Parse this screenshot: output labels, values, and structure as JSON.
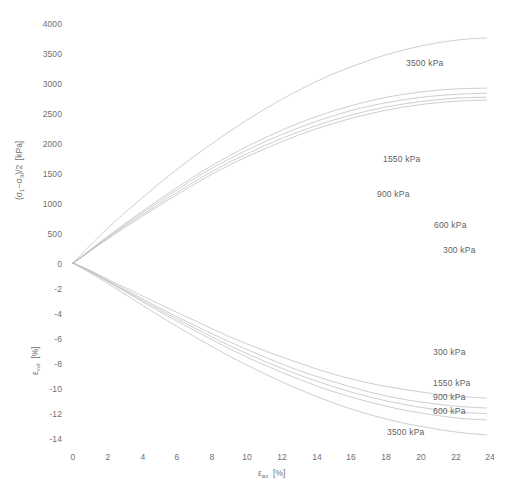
{
  "chart_data": {
    "type": "line",
    "title": "",
    "xlabel": "εax [%]",
    "ylabel_top": "(σ1−σ3)/2  [kPa]",
    "ylabel_bottom": "εvol [%]",
    "grid": false,
    "legend_position": "inline-annotations",
    "xlim": [
      0,
      24
    ],
    "xticks": [
      0,
      2,
      4,
      6,
      8,
      10,
      12,
      14,
      16,
      18,
      20,
      22,
      24
    ],
    "y_top_lim": [
      0,
      4000
    ],
    "y_top_ticks": [
      0,
      500,
      1000,
      1500,
      2000,
      2500,
      3000,
      3500,
      4000
    ],
    "y_bottom_lim": [
      -14,
      0
    ],
    "y_bottom_ticks": [
      0,
      -2,
      -4,
      -6,
      -8,
      -10,
      -12,
      -14
    ],
    "units": {
      "stress": "kPa",
      "strain": "%"
    },
    "confining_pressures": [
      300,
      600,
      900,
      1550,
      3500
    ],
    "series": [
      {
        "name": "3500 kPa",
        "panel": "upper",
        "x": [
          0,
          0.3,
          0.8,
          1.6,
          2.6,
          3.8,
          5.2,
          6.8,
          8.4,
          10.0,
          11.6,
          13.2,
          14.8,
          16.4,
          18.0,
          19.6,
          21.2,
          22.6,
          23.8
        ],
        "y": [
          0,
          90,
          240,
          470,
          740,
          1040,
          1380,
          1740,
          2070,
          2380,
          2660,
          2910,
          3130,
          3310,
          3470,
          3590,
          3680,
          3730,
          3750
        ]
      },
      {
        "name": "1550 kPa",
        "panel": "upper",
        "x": [
          0,
          0.4,
          1.0,
          2.0,
          3.2,
          4.6,
          6.2,
          8.0,
          10.0,
          12.0,
          14.0,
          16.0,
          18.0,
          20.0,
          22.0,
          23.8
        ],
        "y": [
          0,
          85,
          225,
          445,
          700,
          985,
          1300,
          1625,
          1940,
          2210,
          2440,
          2620,
          2760,
          2850,
          2900,
          2915
        ]
      },
      {
        "name": "900 kPa",
        "panel": "upper",
        "x": [
          0,
          0.4,
          1.0,
          2.0,
          3.2,
          4.6,
          6.2,
          8.0,
          10.0,
          12.0,
          14.0,
          16.0,
          18.0,
          20.0,
          22.0,
          23.8
        ],
        "y": [
          0,
          80,
          215,
          430,
          680,
          955,
          1260,
          1580,
          1880,
          2140,
          2360,
          2540,
          2670,
          2760,
          2810,
          2830
        ]
      },
      {
        "name": "600 kPa",
        "panel": "upper",
        "x": [
          0,
          0.4,
          1.0,
          2.0,
          3.2,
          4.6,
          6.2,
          8.0,
          10.0,
          12.0,
          14.0,
          16.0,
          18.0,
          20.0,
          22.0,
          23.8
        ],
        "y": [
          0,
          78,
          208,
          415,
          655,
          920,
          1215,
          1525,
          1820,
          2075,
          2290,
          2465,
          2600,
          2690,
          2745,
          2765
        ]
      },
      {
        "name": "300 kPa",
        "panel": "upper",
        "x": [
          0,
          0.4,
          1.0,
          2.0,
          3.2,
          4.6,
          6.2,
          8.0,
          10.0,
          12.0,
          14.0,
          16.0,
          18.0,
          20.0,
          22.0,
          23.8
        ],
        "y": [
          0,
          75,
          200,
          400,
          630,
          890,
          1175,
          1480,
          1770,
          2020,
          2235,
          2410,
          2545,
          2640,
          2695,
          2715
        ]
      },
      {
        "name": "300 kPa",
        "panel": "lower",
        "x": [
          0,
          1.0,
          2.0,
          3.5,
          5.0,
          7.0,
          9.0,
          11.0,
          13.0,
          15.0,
          17.0,
          19.0,
          21.0,
          22.5,
          23.8
        ],
        "y": [
          0,
          -0.6,
          -1.3,
          -2.3,
          -3.3,
          -4.6,
          -5.9,
          -7.0,
          -8.0,
          -8.9,
          -9.6,
          -10.1,
          -10.5,
          -10.7,
          -10.8
        ]
      },
      {
        "name": "1550 kPa",
        "panel": "lower",
        "x": [
          0,
          1.0,
          2.0,
          3.5,
          5.0,
          7.0,
          9.0,
          11.0,
          13.0,
          15.0,
          17.0,
          19.0,
          21.0,
          22.5,
          23.8
        ],
        "y": [
          0,
          -0.65,
          -1.4,
          -2.5,
          -3.6,
          -5.0,
          -6.3,
          -7.5,
          -8.6,
          -9.5,
          -10.3,
          -10.9,
          -11.3,
          -11.5,
          -11.6
        ]
      },
      {
        "name": "900 kPa",
        "panel": "lower",
        "x": [
          0,
          1.0,
          2.0,
          3.5,
          5.0,
          7.0,
          9.0,
          11.0,
          13.0,
          15.0,
          17.0,
          19.0,
          21.0,
          22.5,
          23.8
        ],
        "y": [
          0,
          -0.7,
          -1.45,
          -2.6,
          -3.75,
          -5.2,
          -6.6,
          -7.85,
          -8.95,
          -9.9,
          -10.7,
          -11.3,
          -11.75,
          -11.95,
          -12.05
        ]
      },
      {
        "name": "600 kPa",
        "panel": "lower",
        "x": [
          0,
          1.0,
          2.0,
          3.5,
          5.0,
          7.0,
          9.0,
          11.0,
          13.0,
          15.0,
          17.0,
          19.0,
          21.0,
          22.5,
          23.8
        ],
        "y": [
          0,
          -0.72,
          -1.5,
          -2.7,
          -3.9,
          -5.4,
          -6.85,
          -8.15,
          -9.3,
          -10.3,
          -11.1,
          -11.75,
          -12.2,
          -12.45,
          -12.55
        ]
      },
      {
        "name": "3500 kPa",
        "panel": "lower",
        "x": [
          0,
          1.0,
          2.0,
          3.5,
          5.0,
          7.0,
          9.0,
          11.0,
          13.0,
          15.0,
          17.0,
          19.0,
          21.0,
          22.5,
          23.8
        ],
        "y": [
          0,
          -0.8,
          -1.65,
          -2.95,
          -4.25,
          -5.9,
          -7.45,
          -8.85,
          -10.1,
          -11.2,
          -12.1,
          -12.8,
          -13.3,
          -13.6,
          -13.75
        ]
      }
    ]
  },
  "axes": {
    "y_top_tick_labels": [
      "4000",
      "3500",
      "3000",
      "2500",
      "2000",
      "1500",
      "1000",
      "500",
      "0"
    ],
    "y_bottom_tick_labels": [
      "-2",
      "-4",
      "-6",
      "-8",
      "-10",
      "-12",
      "-14"
    ],
    "x_tick_labels": [
      "0",
      "2",
      "4",
      "6",
      "8",
      "10",
      "12",
      "14",
      "16",
      "18",
      "20",
      "22",
      "24"
    ],
    "y_top_title_prefix": "(σ",
    "y_top_title_sub1": "1",
    "y_top_title_mid": "−σ",
    "y_top_title_sub3": "3",
    "y_top_title_suffix": ")/2",
    "y_top_title_unit": "[kPa]",
    "y_bottom_title_symbol": "ε",
    "y_bottom_title_sub": "vol",
    "y_bottom_title_unit": "[%]",
    "x_title_symbol": "ε",
    "x_title_sub": "ax",
    "x_title_unit": "[%]"
  },
  "annotations_upper": [
    {
      "label": "3500 kPa"
    },
    {
      "label": "1550 kPa"
    },
    {
      "label": "900 kPa"
    },
    {
      "label": "600 kPa"
    },
    {
      "label": "300 kPa"
    }
  ],
  "annotations_lower": [
    {
      "label": "300 kPa"
    },
    {
      "label": "1550 kPa"
    },
    {
      "label": "900 kPa"
    },
    {
      "label": "600 kPa"
    },
    {
      "label": "3500 kPa"
    }
  ],
  "style": {
    "background": "#ffffff",
    "line_color": "#b9b9b9",
    "text_color": "#6f6f6f",
    "axis_color": "#a8a8a8"
  }
}
